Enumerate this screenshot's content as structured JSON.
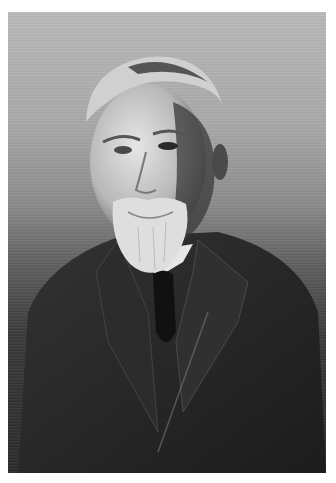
{
  "image": {
    "description": "Black-and-white studio portrait of an elderly man with white hair, white mustache and beard, wearing a dark suit jacket, waistcoat, white shirt and dark tie",
    "style": "monochrome photograph",
    "colors": {
      "frame": "#ffffff",
      "background_top": "#b9b9b9",
      "background_bottom": "#2a2a2a",
      "suit": "#262626",
      "hair_beard": "#e4e4e4",
      "skin": "#cfcfcf",
      "shirt": "#e8e8e8",
      "tie": "#121212"
    }
  }
}
